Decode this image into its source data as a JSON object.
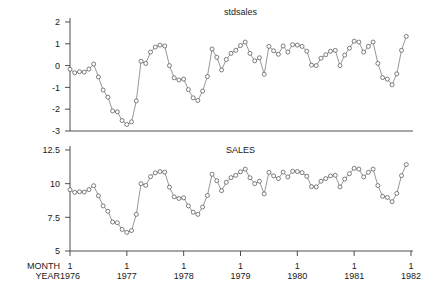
{
  "chart_data": [
    {
      "type": "line",
      "title": "stdsales",
      "xlabel": "",
      "ylabel": "",
      "ylim": [
        -3,
        2
      ],
      "yticks": [
        2,
        1,
        0,
        -1,
        -2,
        -3
      ],
      "ytick_labels": [
        "2",
        "1",
        "0",
        "-1",
        "-2",
        "-3"
      ],
      "xlim": [
        1976.0,
        1982.0
      ],
      "xticks": [
        1976,
        1977,
        1978,
        1979,
        1980,
        1981,
        1982
      ],
      "xtick_labels": [
        "1",
        "1",
        "1",
        "1",
        "1",
        "1",
        "1"
      ],
      "xtick_sublabels": [
        "1976",
        "1977",
        "1978",
        "1979",
        "1980",
        "1981",
        "1982"
      ],
      "grid": false,
      "legend": "none",
      "marker": "open-circle",
      "x": [
        1976.0,
        1976.083,
        1976.167,
        1976.25,
        1976.333,
        1976.417,
        1976.5,
        1976.583,
        1976.667,
        1976.75,
        1976.833,
        1976.917,
        1977.0,
        1977.083,
        1977.167,
        1977.25,
        1977.333,
        1977.417,
        1977.5,
        1977.583,
        1977.667,
        1977.75,
        1977.833,
        1977.917,
        1978.0,
        1978.083,
        1978.167,
        1978.25,
        1978.333,
        1978.417,
        1978.5,
        1978.583,
        1978.667,
        1978.75,
        1978.833,
        1978.917,
        1979.0,
        1979.083,
        1979.167,
        1979.25,
        1979.333,
        1979.417,
        1979.5,
        1979.583,
        1979.667,
        1979.75,
        1979.833,
        1979.917,
        1980.0,
        1980.083,
        1980.167,
        1980.25,
        1980.333,
        1980.417,
        1980.5,
        1980.583,
        1980.667,
        1980.75,
        1980.833,
        1980.917,
        1981.0,
        1981.083,
        1981.167,
        1981.25,
        1981.333,
        1981.417,
        1981.5,
        1981.583,
        1981.667,
        1981.75,
        1981.833,
        1981.917
      ],
      "values": [
        -0.17,
        -0.33,
        -0.28,
        -0.3,
        -0.16,
        0.07,
        -0.52,
        -1.12,
        -1.45,
        -2.08,
        -2.12,
        -2.52,
        -2.7,
        -2.58,
        -1.62,
        0.2,
        0.1,
        0.62,
        0.85,
        0.94,
        0.9,
        0.0,
        -0.56,
        -0.66,
        -0.62,
        -1.1,
        -1.48,
        -1.6,
        -1.17,
        -0.5,
        0.76,
        0.38,
        -0.2,
        0.28,
        0.56,
        0.7,
        0.92,
        1.08,
        0.56,
        0.22,
        0.36,
        -0.4,
        0.88,
        0.68,
        0.52,
        0.9,
        0.62,
        0.96,
        0.94,
        0.88,
        0.66,
        0.02,
        0.0,
        0.34,
        0.5,
        0.66,
        0.7,
        0.0,
        0.48,
        0.8,
        1.12,
        1.08,
        0.62,
        0.88,
        1.08,
        0.1,
        -0.55,
        -0.62,
        -0.88,
        -0.38,
        0.7,
        1.34
      ]
    },
    {
      "type": "line",
      "title": "SALES",
      "xlabel": "",
      "ylabel": "",
      "ylim": [
        5,
        12.5
      ],
      "yticks": [
        12.5,
        10,
        7.5,
        5
      ],
      "ytick_labels": [
        "12.5",
        "10",
        "7.5",
        "5"
      ],
      "xlim": [
        1976.0,
        1982.0
      ],
      "xticks": [
        1976,
        1977,
        1978,
        1979,
        1980,
        1981,
        1982
      ],
      "xtick_labels": [
        "1",
        "1",
        "1",
        "1",
        "1",
        "1",
        "1"
      ],
      "xtick_sublabels": [
        "1976",
        "1977",
        "1978",
        "1979",
        "1980",
        "1981",
        "1982"
      ],
      "grid": false,
      "legend": "none",
      "marker": "open-circle",
      "x": [
        1976.0,
        1976.083,
        1976.167,
        1976.25,
        1976.333,
        1976.417,
        1976.5,
        1976.583,
        1976.667,
        1976.75,
        1976.833,
        1976.917,
        1977.0,
        1977.083,
        1977.167,
        1977.25,
        1977.333,
        1977.417,
        1977.5,
        1977.583,
        1977.667,
        1977.75,
        1977.833,
        1977.917,
        1978.0,
        1978.083,
        1978.167,
        1978.25,
        1978.333,
        1978.417,
        1978.5,
        1978.583,
        1978.667,
        1978.75,
        1978.833,
        1978.917,
        1979.0,
        1979.083,
        1979.167,
        1979.25,
        1979.333,
        1979.417,
        1979.5,
        1979.583,
        1979.667,
        1979.75,
        1979.833,
        1979.917,
        1980.0,
        1980.083,
        1980.167,
        1980.25,
        1980.333,
        1980.417,
        1980.5,
        1980.583,
        1980.667,
        1980.75,
        1980.833,
        1980.917,
        1981.0,
        1981.083,
        1981.167,
        1981.25,
        1981.333,
        1981.417,
        1981.5,
        1981.583,
        1981.667,
        1981.75,
        1981.833,
        1981.917
      ],
      "values": [
        9.55,
        9.35,
        9.4,
        9.38,
        9.56,
        9.85,
        9.1,
        8.35,
        7.95,
        7.15,
        7.1,
        6.6,
        6.38,
        6.52,
        7.72,
        10.0,
        9.87,
        10.52,
        10.8,
        10.9,
        10.86,
        9.74,
        9.02,
        8.9,
        8.95,
        8.35,
        7.88,
        7.72,
        8.26,
        9.12,
        10.7,
        10.22,
        9.48,
        10.1,
        10.45,
        10.62,
        10.88,
        11.08,
        10.44,
        10.0,
        10.18,
        9.24,
        10.84,
        10.58,
        10.38,
        10.86,
        10.5,
        10.92,
        10.9,
        10.82,
        10.55,
        9.78,
        9.76,
        10.18,
        10.38,
        10.58,
        10.62,
        9.76,
        10.34,
        10.74,
        11.14,
        11.08,
        10.5,
        10.84,
        11.08,
        9.86,
        9.06,
        8.98,
        8.66,
        9.28,
        10.6,
        11.42
      ]
    }
  ],
  "axis_names": {
    "month": "MONTH",
    "year": "YEAR"
  }
}
